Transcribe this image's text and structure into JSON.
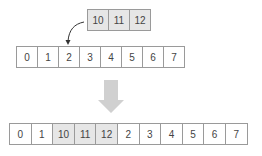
{
  "insert_values": [
    "10",
    "11",
    "12"
  ],
  "original_array": [
    "0",
    "1",
    "2",
    "3",
    "4",
    "5",
    "6",
    "7"
  ],
  "result_array": [
    "0",
    "1",
    "10",
    "11",
    "12",
    "2",
    "3",
    "4",
    "5",
    "6",
    "7"
  ],
  "insert_index": 2,
  "colors": {
    "border": "#9a9a9a",
    "highlight_fill": "#e6e6e6",
    "arrow_fill": "#d0d0d0",
    "text": "#444444"
  }
}
